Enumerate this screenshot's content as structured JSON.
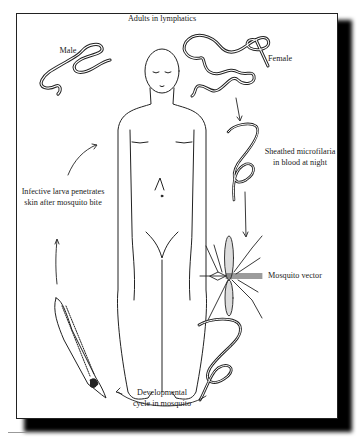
{
  "figure": {
    "title": "Adults in lymphatics",
    "labels": {
      "male": "Male",
      "female": "Female",
      "microfilaria_line1": "Sheathed microfilaria",
      "microfilaria_line2": "in blood at night",
      "mosquito": "Mosquito vector",
      "larva_line1": "Infective larva penetrates",
      "larva_line2": "skin after mosquito bite",
      "dev_line1": "Developmental",
      "dev_line2": "cycle in mosquito"
    },
    "stages": [
      {
        "id": "adults",
        "name": "Adults in lymphatics"
      },
      {
        "id": "microfilaria",
        "name": "Sheathed microfilaria in blood at night"
      },
      {
        "id": "mosquito",
        "name": "Mosquito vector"
      },
      {
        "id": "development",
        "name": "Developmental cycle in mosquito"
      },
      {
        "id": "infective-larva",
        "name": "Infective larva penetrates skin after mosquito bite"
      }
    ],
    "colors": {
      "ink": "#222222",
      "frame_shadow": "#000000",
      "background": "#ffffff"
    }
  }
}
